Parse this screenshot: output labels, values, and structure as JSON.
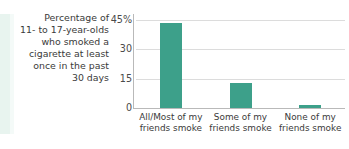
{
  "caption": {
    "lines": [
      "Percentage of",
      "11- to 17-year-olds",
      "who smoked a",
      "cigarette at least",
      "once in the past",
      "30 days"
    ]
  },
  "colors": {
    "bar": "#3da08a",
    "gridline": "#dcdcdc",
    "axis": "#b9b9b9",
    "text": "#3a3a3a",
    "edge_band": "#e8f4ef",
    "background": "#ffffff"
  },
  "chart_data": {
    "type": "bar",
    "title": "",
    "subtitle": "",
    "xlabel": "",
    "ylabel": "",
    "categories": [
      "All/Most of my friends smoke",
      "Some of my friends smoke",
      "None of my friends smoke"
    ],
    "category_lines": [
      [
        "All/Most of my",
        "friends smoke"
      ],
      [
        "Some of my",
        "friends smoke"
      ],
      [
        "None of my",
        "friends smoke"
      ]
    ],
    "values": [
      43.5,
      13,
      1.5
    ],
    "ylim": [
      0,
      45
    ],
    "yticks": [
      0,
      15,
      30,
      45
    ],
    "ytick_labels": [
      "0",
      "15",
      "30",
      "45%"
    ],
    "grid": true,
    "legend": "none"
  }
}
